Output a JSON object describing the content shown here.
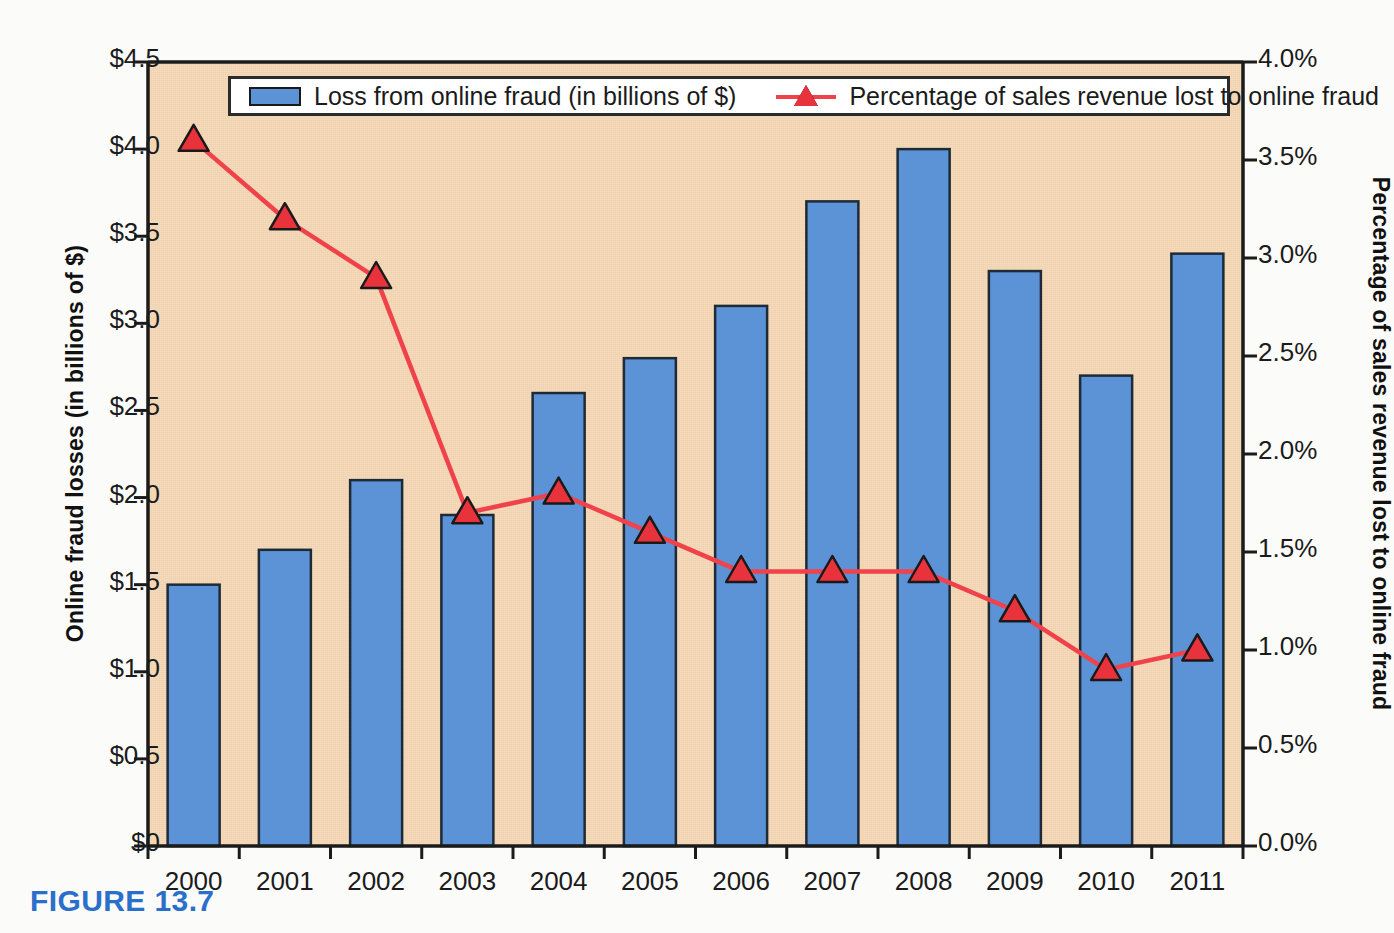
{
  "figure": {
    "caption": "FIGURE 13.7"
  },
  "legend": {
    "items": [
      {
        "label": "Loss from online fraud (in billions of $)",
        "marker": "bar-swatch",
        "color": "#5b93d6"
      },
      {
        "label": "Percentage of sales revenue lost to online fraud",
        "marker": "triangle-line",
        "color": "#e8323c"
      }
    ]
  },
  "axes": {
    "left": {
      "title": "Online fraud losses (in billions of $)",
      "ticks": [
        "$0",
        "$0.5",
        "$1.0",
        "$1.5",
        "$2.0",
        "$2.5",
        "$3.0",
        "$3.5",
        "$4.0",
        "$4.5"
      ],
      "min": 0,
      "max": 4.5
    },
    "right": {
      "title": "Percentage of sales revenue lost to online fraud",
      "ticks": [
        "0.0%",
        "0.5%",
        "1.0%",
        "1.5%",
        "2.0%",
        "2.5%",
        "3.0%",
        "3.5%",
        "4.0%"
      ],
      "min": 0,
      "max": 4.0
    },
    "bottom": {
      "ticks": [
        "2000",
        "2001",
        "2002",
        "2003",
        "2004",
        "2005",
        "2006",
        "2007",
        "2008",
        "2009",
        "2010",
        "2011"
      ]
    }
  },
  "colors": {
    "plot_background": "#f4d7b4",
    "bar_fill": "#5b93d6",
    "bar_stroke": "#1f2a37",
    "line": "#f0424a",
    "marker_fill": "#e8323c",
    "marker_stroke": "#1a1a1a",
    "caption": "#2a6fc9",
    "axis": "#1b1b1b"
  },
  "chart_data": {
    "type": "bar",
    "title": "",
    "subtitle": "",
    "xlabel": "",
    "ylabel": "Online fraud losses (in billions of $)",
    "y2label": "Percentage of sales revenue lost to online fraud",
    "categories": [
      "2000",
      "2001",
      "2002",
      "2003",
      "2004",
      "2005",
      "2006",
      "2007",
      "2008",
      "2009",
      "2010",
      "2011"
    ],
    "ylim": [
      0,
      4.5
    ],
    "y2lim": [
      0,
      4.0
    ],
    "grid": false,
    "legend_position": "top-inside",
    "series": [
      {
        "name": "Loss from online fraud (in billions of $)",
        "type": "bar",
        "axis": "left",
        "unit": "billions of $",
        "values": [
          1.5,
          1.7,
          2.1,
          1.9,
          2.6,
          2.8,
          3.1,
          3.7,
          4.0,
          3.3,
          2.7,
          3.4
        ]
      },
      {
        "name": "Percentage of sales revenue lost to online fraud",
        "type": "line",
        "axis": "right",
        "unit": "%",
        "values": [
          3.6,
          3.2,
          2.9,
          1.7,
          1.8,
          1.6,
          1.4,
          1.4,
          1.4,
          1.2,
          0.9,
          1.0
        ]
      }
    ]
  }
}
